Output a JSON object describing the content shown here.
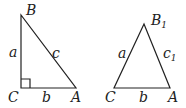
{
  "diagram": {
    "triangles": [
      {
        "name": "right-triangle",
        "vertices": {
          "B": [
            21,
            15
          ],
          "C": [
            21,
            88
          ],
          "A": [
            76,
            88
          ]
        },
        "right_angle_at": "C",
        "labels": {
          "B": "B",
          "C": "C",
          "A": "A",
          "side_a": "a",
          "side_b": "b",
          "side_c": "c"
        }
      },
      {
        "name": "acute-triangle",
        "vertices": {
          "B1": [
            144,
            24
          ],
          "C": [
            114,
            88
          ],
          "A": [
            170,
            88
          ]
        },
        "labels": {
          "B": "B",
          "B_sub": "1",
          "C": "C",
          "A": "A",
          "side_a": "a",
          "side_b": "b",
          "side_c": "c",
          "side_c_sub": "1"
        }
      }
    ],
    "stroke_color": "#222222"
  }
}
